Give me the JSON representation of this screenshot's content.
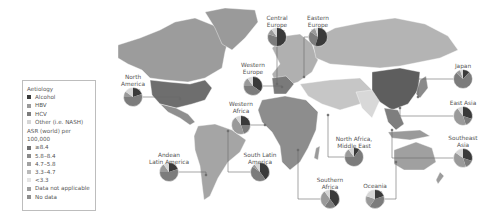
{
  "legend": {
    "aetiology_heading": "Aetiology",
    "aetiology": [
      {
        "label": "Alcohol",
        "color": "#3a3a3a"
      },
      {
        "label": "HBV",
        "color": "#9a9a9a"
      },
      {
        "label": "HCV",
        "color": "#7c7c7c"
      },
      {
        "label": "Other (i.e. NASH)",
        "color": "#d6d6d6"
      }
    ],
    "asr_heading": "ASR (world) per 100,000",
    "asr": [
      {
        "label": "≥8.4",
        "color": "#6f6f6f"
      },
      {
        "label": "5.8–8.4",
        "color": "#8a8a8a"
      },
      {
        "label": "4.7–5.8",
        "color": "#a2a2a2"
      },
      {
        "label": "3.3–4.7",
        "color": "#bababa"
      },
      {
        "label": "<3.3",
        "color": "#e4e4e4"
      },
      {
        "label": "Data not applicable",
        "color": "#9e9e9e"
      },
      {
        "label": "No data",
        "color": "#8e8e8e"
      }
    ]
  },
  "regions": [
    {
      "name": "North America",
      "lines": [
        "North",
        "America"
      ],
      "label_x": 133,
      "label_y": 74,
      "pie_x": 133,
      "pie_y": 97,
      "anchor_x": 180,
      "anchor_y": 99,
      "slices": {
        "Alcohol": 0.2,
        "HBV": 0.1,
        "HCV": 0.55,
        "Other": 0.15
      }
    },
    {
      "name": "Andean Latin America",
      "lines": [
        "Andean",
        "Latin America"
      ],
      "label_x": 169,
      "label_y": 152,
      "pie_x": 169,
      "pie_y": 172,
      "anchor_x": 206,
      "anchor_y": 175,
      "slices": {
        "Alcohol": 0.2,
        "HBV": 0.15,
        "HCV": 0.55,
        "Other": 0.1
      }
    },
    {
      "name": "South Latin America",
      "lines": [
        "South Latin",
        "America"
      ],
      "label_x": 260,
      "label_y": 152,
      "pie_x": 260,
      "pie_y": 172,
      "anchor_x": 228,
      "anchor_y": 131,
      "slices": {
        "Alcohol": 0.4,
        "HBV": 0.05,
        "HCV": 0.45,
        "Other": 0.1
      }
    },
    {
      "name": "Western Europe",
      "lines": [
        "Western",
        "Europe"
      ],
      "label_x": 253,
      "label_y": 62,
      "pie_x": 253,
      "pie_y": 86,
      "anchor_x": 282,
      "anchor_y": 87,
      "slices": {
        "Alcohol": 0.35,
        "HBV": 0.15,
        "HCV": 0.4,
        "Other": 0.1
      }
    },
    {
      "name": "Western Africa",
      "lines": [
        "Western",
        "Africa"
      ],
      "label_x": 241,
      "label_y": 101,
      "pie_x": 241,
      "pie_y": 125,
      "anchor_x": 265,
      "anchor_y": 125,
      "slices": {
        "Alcohol": 0.25,
        "HBV": 0.45,
        "HCV": 0.2,
        "Other": 0.1
      }
    },
    {
      "name": "Central Europe",
      "lines": [
        "Central",
        "Europe"
      ],
      "label_x": 277,
      "label_y": 15,
      "pie_x": 277,
      "pie_y": 37,
      "anchor_x": 277,
      "anchor_y": 84,
      "slices": {
        "Alcohol": 0.5,
        "HBV": 0.1,
        "HCV": 0.3,
        "Other": 0.1
      }
    },
    {
      "name": "Eastern Europe",
      "lines": [
        "Eastern",
        "Europe"
      ],
      "label_x": 318,
      "label_y": 15,
      "pie_x": 318,
      "pie_y": 37,
      "anchor_x": 304,
      "anchor_y": 77,
      "slices": {
        "Alcohol": 0.55,
        "HBV": 0.1,
        "HCV": 0.3,
        "Other": 0.05
      }
    },
    {
      "name": "North Africa, Middle East",
      "lines": [
        "North Africa,",
        "Middle East"
      ],
      "label_x": 354,
      "label_y": 136,
      "pie_x": 354,
      "pie_y": 157,
      "anchor_x": 328,
      "anchor_y": 115,
      "slices": {
        "Alcohol": 0.1,
        "HBV": 0.15,
        "HCV": 0.65,
        "Other": 0.1
      }
    },
    {
      "name": "Southern Africa",
      "lines": [
        "Southern",
        "Africa"
      ],
      "label_x": 330,
      "label_y": 177,
      "pie_x": 330,
      "pie_y": 199,
      "anchor_x": 298,
      "anchor_y": 150,
      "slices": {
        "Alcohol": 0.4,
        "HBV": 0.3,
        "HCV": 0.2,
        "Other": 0.1
      }
    },
    {
      "name": "Oceania",
      "lines": [
        "Oceania"
      ],
      "label_x": 375,
      "label_y": 183,
      "pie_x": 375,
      "pie_y": 199,
      "anchor_x": 396,
      "anchor_y": 162,
      "slices": {
        "Alcohol": 0.2,
        "HBV": 0.2,
        "HCV": 0.4,
        "Other": 0.2
      }
    },
    {
      "name": "Japan",
      "lines": [
        "Japan"
      ],
      "label_x": 463,
      "label_y": 63,
      "pie_x": 463,
      "pie_y": 79,
      "anchor_x": 418,
      "anchor_y": 97,
      "slices": {
        "Alcohol": 0.12,
        "HBV": 0.08,
        "HCV": 0.75,
        "Other": 0.05
      }
    },
    {
      "name": "East Asia",
      "lines": [
        "East Asia"
      ],
      "label_x": 463,
      "label_y": 100,
      "pie_x": 463,
      "pie_y": 116,
      "anchor_x": 400,
      "anchor_y": 108,
      "slices": {
        "Alcohol": 0.3,
        "HBV": 0.45,
        "HCV": 0.15,
        "Other": 0.1
      }
    },
    {
      "name": "Southeast Asia",
      "lines": [
        "Southeast",
        "Asia"
      ],
      "label_x": 463,
      "label_y": 135,
      "pie_x": 463,
      "pie_y": 158,
      "anchor_x": 392,
      "anchor_y": 130,
      "slices": {
        "Alcohol": 0.3,
        "HBV": 0.4,
        "HCV": 0.15,
        "Other": 0.15
      }
    }
  ],
  "colors": {
    "alcohol": "#3a3a3a",
    "hbv": "#9a9a9a",
    "hcv": "#7c7c7c",
    "other": "#d6d6d6",
    "leader_line": "#6a6a6a"
  }
}
